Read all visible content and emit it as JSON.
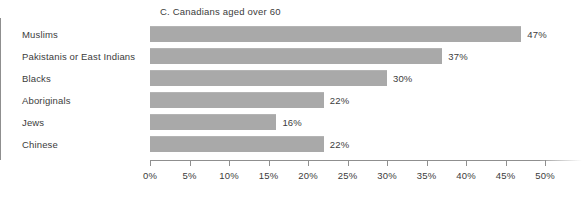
{
  "chart_data": {
    "type": "bar",
    "orientation": "horizontal",
    "title": "C. Canadians aged over 60",
    "xlabel": "",
    "ylabel": "",
    "categories": [
      "Muslims",
      "Pakistanis or East Indians",
      "Blacks",
      "Aboriginals",
      "Jews",
      "Chinese"
    ],
    "values": [
      47,
      37,
      30,
      22,
      16,
      22
    ],
    "value_labels": [
      "47%",
      "37%",
      "30%",
      "22%",
      "16%",
      "22%"
    ],
    "xlim": [
      0,
      50
    ],
    "xticks": [
      0,
      5,
      10,
      15,
      20,
      25,
      30,
      35,
      40,
      45,
      50
    ],
    "xtick_labels": [
      "0%",
      "5%",
      "10%",
      "15%",
      "20%",
      "25%",
      "30%",
      "35%",
      "40%",
      "45%",
      "50%"
    ],
    "grid": false,
    "legend": null,
    "bar_color": "#a9a9a9",
    "axis_color": "#8f8f8f",
    "text_color": "#3c3c3c"
  }
}
